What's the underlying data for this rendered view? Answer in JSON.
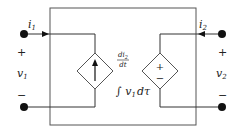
{
  "diagram": {
    "type": "two-port circuit",
    "port1": {
      "current": "i",
      "current_sub": "1",
      "voltage": "v",
      "voltage_sub": "1",
      "plus": "+",
      "minus": "−"
    },
    "port2": {
      "current": "i",
      "current_sub": "2",
      "voltage": "v",
      "voltage_sub": "2",
      "plus": "+",
      "minus": "−"
    },
    "left_source": {
      "kind": "dependent current source",
      "label_num": "di",
      "label_num_sub": "2",
      "label_den": "dt"
    },
    "right_source": {
      "kind": "dependent voltage source",
      "plus": "+",
      "minus": "−",
      "label": "∫ v",
      "label_sub": "1",
      "label_tail": "dτ"
    },
    "colors": {
      "line": "#333333",
      "box": "#555555",
      "node": "#111111"
    }
  }
}
